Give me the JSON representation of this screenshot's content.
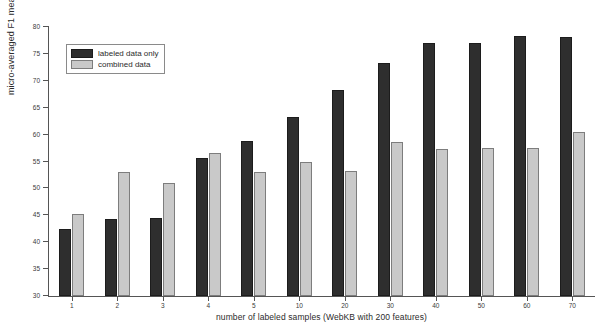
{
  "chart_data": {
    "type": "bar",
    "title": "",
    "subtitle": "",
    "xlabel": "number of labeled samples (WebKB with 200 features)",
    "ylabel": "micro-averaged F1 measure",
    "categories": [
      "1",
      "2",
      "3",
      "4",
      "5",
      "10",
      "20",
      "30",
      "40",
      "50",
      "60",
      "70"
    ],
    "series": [
      {
        "name": "labeled data only",
        "color": "#2e2e2e",
        "values": [
          42.4,
          44.4,
          44.5,
          55.7,
          58.8,
          63.2,
          68.2,
          73.3,
          77.0,
          77.0,
          78.3,
          78.2
        ]
      },
      {
        "name": "combined data",
        "color": "#c9c9c9",
        "values": [
          45.2,
          53.0,
          51.0,
          56.5,
          53.0,
          55.0,
          53.3,
          58.7,
          57.4,
          57.5,
          57.5,
          60.4
        ]
      }
    ],
    "ylim": [
      30,
      80
    ],
    "ytick_values": [
      30,
      35,
      40,
      45,
      50,
      55,
      60,
      65,
      70,
      75,
      80
    ],
    "ytick_labels": [
      "30",
      "35",
      "40",
      "45",
      "50",
      "55",
      "60",
      "65",
      "70",
      "75",
      "80"
    ],
    "grid": false,
    "legend_position": "upper-left-inside"
  },
  "legend": {
    "entries": [
      {
        "label": "labeled data only",
        "swatch": "dark-swatch"
      },
      {
        "label": "combined data",
        "swatch": "light-swatch"
      }
    ]
  }
}
